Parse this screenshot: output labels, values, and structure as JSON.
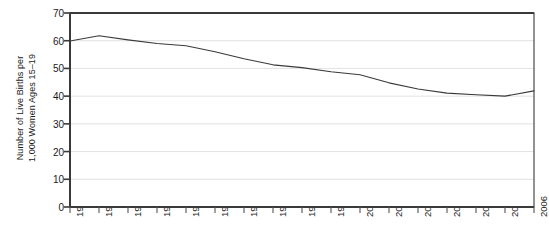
{
  "chart_data": {
    "type": "line",
    "title": "",
    "subtitle": "",
    "xlabel": "",
    "ylabel": "Number of Live Births per\n1,000 Women Ages 15–19",
    "ylabel_line1": "Number of Live Births per",
    "ylabel_line2": "1,000 Women Ages 15–19",
    "categories": [
      "1990",
      "1991",
      "1992",
      "1993",
      "1994",
      "1995",
      "1996",
      "1997",
      "1998",
      "1999",
      "2000",
      "2001",
      "2002",
      "2003",
      "2004",
      "2005",
      "2006"
    ],
    "x": [
      1990,
      1991,
      1992,
      1993,
      1994,
      1995,
      1996,
      1997,
      1998,
      1999,
      2000,
      2001,
      2002,
      2003,
      2004,
      2005,
      2006
    ],
    "values": [
      59.9,
      61.8,
      60.3,
      59.0,
      58.2,
      56.0,
      53.5,
      51.3,
      50.3,
      48.8,
      47.7,
      44.8,
      42.6,
      41.1,
      40.5,
      40.0,
      41.9
    ],
    "series": [
      {
        "name": "Teen birth rate",
        "values": [
          59.9,
          61.8,
          60.3,
          59.0,
          58.2,
          56.0,
          53.5,
          51.3,
          50.3,
          48.8,
          47.7,
          44.8,
          42.6,
          41.1,
          40.5,
          40.0,
          41.9
        ],
        "color": "#3a3a3a"
      }
    ],
    "ylim": [
      0,
      70
    ],
    "yticks": [
      0,
      10,
      20,
      30,
      40,
      50,
      60,
      70
    ],
    "ytick_labels": [
      "0",
      "10",
      "20",
      "30",
      "40",
      "50",
      "60",
      "70"
    ],
    "xlim": [
      1990,
      2006
    ],
    "grid": "horizontal",
    "grid_color": "#d9d9d9",
    "legend": "none",
    "axis_color": "#4a4a4a",
    "background": "#ffffff",
    "xtick_rotation": -90
  }
}
